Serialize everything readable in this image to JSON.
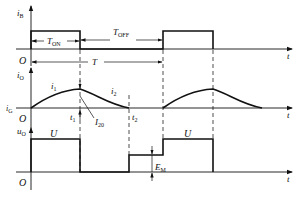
{
  "diagram": {
    "type": "chopper-waveforms",
    "colors": {
      "line": "#111111",
      "background": "#ffffff"
    },
    "panels": [
      {
        "id": "iB",
        "y_label": "i",
        "y_label_sub": "B",
        "origin_label": "O",
        "x_label": "t",
        "annotations": {
          "t_on": "T",
          "t_on_sub": "ON",
          "t_off": "T",
          "t_off_sub": "OFF",
          "period": "T"
        }
      },
      {
        "id": "iO",
        "y_label": "i",
        "y_label_sub": "O",
        "origin_label": "O",
        "x_label": "t",
        "level_label": "i",
        "level_label_sub": "G",
        "curve_labels": {
          "rise": "i",
          "rise_sub": "1",
          "fall": "i",
          "fall_sub": "2",
          "initial": "I",
          "initial_sub": "20"
        },
        "time_marks": {
          "t1": "t",
          "t1_sub": "1",
          "t2": "t",
          "t2_sub": "2"
        }
      },
      {
        "id": "uO",
        "y_label": "u",
        "y_label_sub": "O",
        "origin_label": "O",
        "x_label": "t",
        "level_labels": {
          "u1": "U",
          "u2": "U",
          "em": "E",
          "em_sub": "M"
        }
      }
    ]
  }
}
